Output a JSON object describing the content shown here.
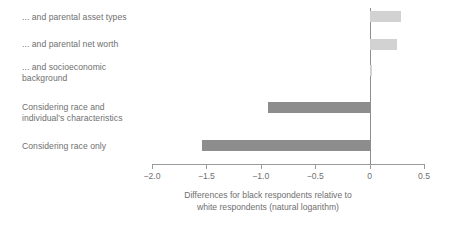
{
  "chart_data": {
    "type": "bar",
    "orientation": "horizontal",
    "title": "",
    "xlabel": "Differences for black respondents relative to\nwhite respondents (natural logarithm)",
    "ylabel": "",
    "categories": [
      "... and parental asset types",
      "... and parental net worth",
      "... and socioeconomic\nbackground",
      "Considering race and\nindividual's characteristics",
      "Considering race only"
    ],
    "values": [
      0.29,
      0.25,
      0.02,
      -0.93,
      -1.54
    ],
    "xlim": [
      -2.0,
      0.5
    ],
    "xticks": [
      -2.0,
      -1.5,
      -1.0,
      -0.5,
      0,
      0.5
    ],
    "xtick_labels": [
      "−2.0",
      "−1.5",
      "−1.0",
      "−0.5",
      "0",
      "0.5"
    ],
    "grid": false,
    "legend": "none",
    "colors": {
      "positive_bar": "#d2d2d2",
      "negative_bar": "#8d8d8d",
      "axis": "#9a9a9a",
      "zero_line": "#8e8e8e",
      "text": "#6f6f6f",
      "background": "#ffffff"
    }
  }
}
